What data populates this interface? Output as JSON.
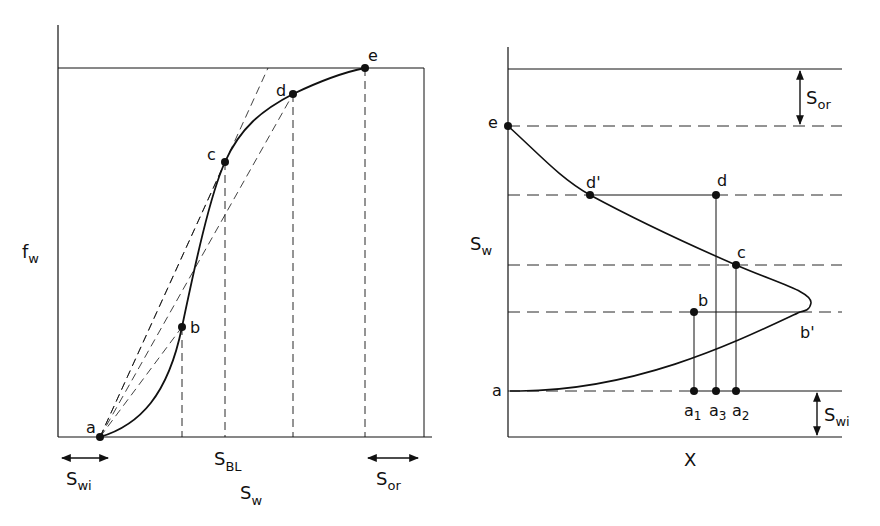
{
  "colors": {
    "ink": "#111111",
    "background": "#ffffff"
  },
  "left_panel": {
    "y_axis_label": "f",
    "y_axis_label_sub": "w",
    "x_axis_label": "S",
    "x_axis_label_sub": "w",
    "sbl_label": "S",
    "sbl_label_sub": "BL",
    "swi_label": "S",
    "swi_label_sub": "wi",
    "sor_label": "S",
    "sor_label_sub": "or",
    "points": [
      {
        "id": "a",
        "label": "a"
      },
      {
        "id": "b",
        "label": "b"
      },
      {
        "id": "c",
        "label": "c"
      },
      {
        "id": "d",
        "label": "d"
      },
      {
        "id": "e",
        "label": "e"
      }
    ]
  },
  "right_panel": {
    "y_axis_label": "S",
    "y_axis_label_sub": "w",
    "x_axis_label": "X",
    "sor_label": "S",
    "sor_label_sub": "or",
    "swi_label": "S",
    "swi_label_sub": "wi",
    "points": [
      {
        "id": "e",
        "label": "e"
      },
      {
        "id": "d_prime",
        "label": "d'"
      },
      {
        "id": "d",
        "label": "d"
      },
      {
        "id": "c",
        "label": "c"
      },
      {
        "id": "b",
        "label": "b"
      },
      {
        "id": "b_prime",
        "label": "b'"
      },
      {
        "id": "a",
        "label": "a"
      }
    ],
    "bottom_points": [
      {
        "id": "a1",
        "label": "a",
        "sub": "1"
      },
      {
        "id": "a3",
        "label": "a",
        "sub": "3"
      },
      {
        "id": "a2",
        "label": "a",
        "sub": "2"
      }
    ]
  }
}
